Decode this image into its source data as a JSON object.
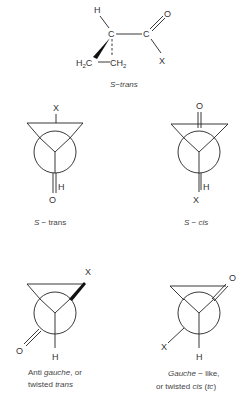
{
  "diagram": {
    "top_structure": {
      "atoms": {
        "h": "H",
        "c1": "C",
        "c2": "C",
        "o": "O",
        "x": "X",
        "h2c_left": "H",
        "h2c_left_sub": "2",
        "h2c_left_c": "C",
        "ch2_right_c": "CH",
        "ch2_right_sub": "2"
      },
      "label_s": "S",
      "label_rest": "−trans"
    },
    "newman": [
      {
        "id": "s-trans",
        "front_top": "X",
        "bottom_h": "H",
        "bottom_o": "O",
        "label_s": "S",
        "label_rest": " − trans"
      },
      {
        "id": "s-cis",
        "front_top": "O",
        "bottom_h": "H",
        "bottom_x": "X",
        "label_s": "S",
        "label_rest": " − cis"
      },
      {
        "id": "anti-gauche",
        "top_right": "X",
        "bottom_left": "O",
        "bottom_h": "H",
        "caption_line1_a": "Anti ",
        "caption_line1_it": "gauche",
        "caption_line1_b": ", or",
        "caption_line2_a": "twisted ",
        "caption_line2_it": "trans"
      },
      {
        "id": "gauche-like",
        "top_right": "O",
        "bottom_left": "X",
        "bottom_h": "H",
        "caption_line1_it": "Gauche",
        "caption_line1_b": " − like,",
        "caption_line2_a": "or twisted ",
        "caption_line2_it": "cis",
        "caption_line2_b": " (",
        "caption_line2_it2": "tc",
        "caption_line2_c": ")"
      }
    ]
  }
}
